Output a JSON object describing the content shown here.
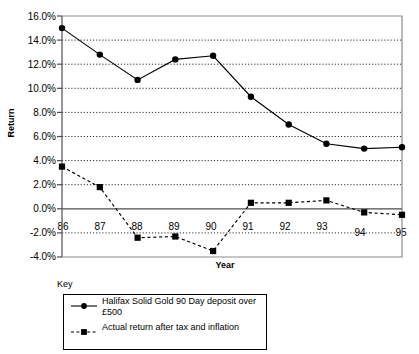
{
  "chart_data": {
    "type": "line",
    "title": "",
    "xlabel": "Year",
    "ylabel": "Return",
    "categories": [
      "86",
      "87",
      "88",
      "89",
      "90",
      "91",
      "92",
      "93",
      "94",
      "95"
    ],
    "ylim": [
      -4.0,
      16.0
    ],
    "ytick_labels": [
      "16.0%",
      "14.0%",
      "12.0%",
      "10.0%",
      "8.0%",
      "6.0%",
      "4.0%",
      "2.0%",
      "0.0%",
      "-2.0%",
      "-4.0%"
    ],
    "ytick_values": [
      16.0,
      14.0,
      12.0,
      10.0,
      8.0,
      6.0,
      4.0,
      2.0,
      0.0,
      -2.0,
      -4.0
    ],
    "grid": true,
    "grid_style": "dotted-horizontal",
    "legend_position": "below-left",
    "legend_title": "Key",
    "series": [
      {
        "name": "Halifax Solid Gold 90 Day deposit over £500",
        "marker": "circle",
        "line_style": "solid",
        "color": "#000000",
        "values": [
          15.0,
          12.8,
          10.7,
          12.4,
          12.7,
          9.3,
          7.0,
          5.4,
          5.0,
          5.1
        ]
      },
      {
        "name": "Actual return after tax and inflation",
        "marker": "square",
        "line_style": "dashed",
        "color": "#000000",
        "values": [
          3.5,
          1.8,
          -2.4,
          -2.3,
          -3.5,
          0.5,
          0.5,
          0.7,
          -0.3,
          -0.5
        ]
      }
    ]
  },
  "legend": {
    "title": "Key",
    "entries": [
      {
        "label": "Halifax Solid Gold 90 Day deposit over £500",
        "marker": "circle",
        "line_style": "solid"
      },
      {
        "label": "Actual return after tax and inflation",
        "marker": "square",
        "line_style": "dashed"
      }
    ]
  },
  "axes": {
    "y_title": "Return",
    "x_title": "Year"
  }
}
